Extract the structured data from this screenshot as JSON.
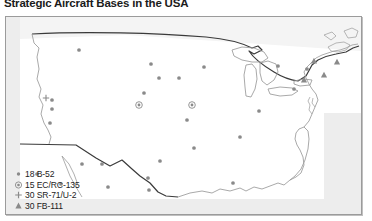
{
  "title": "Strategic Aircraft Bases in the USA",
  "colors": {
    "marker": "#8a8a8a",
    "coastline": "#9a9a9a",
    "border_line": "#3a3a3a",
    "frame": "#9b9b9b",
    "ocean": "#ededed",
    "text": "#1c1c1c"
  },
  "legend": {
    "items": [
      {
        "symbol": "dot-icon",
        "symbol_char": "•",
        "label": "18 B-52"
      },
      {
        "symbol": "circled-dot-icon",
        "symbol_char": "⊙",
        "label": "15 EC/RC-135"
      },
      {
        "symbol": "plus-icon",
        "symbol_char": "+",
        "label": "30 SR-71/U-2"
      },
      {
        "symbol": "triangle-icon",
        "symbol_char": "▲",
        "label": "30 FB-111"
      }
    ]
  },
  "map": {
    "region": "Continental United States",
    "markers": [
      {
        "type": "dot",
        "x": 73,
        "y": 33
      },
      {
        "type": "dot",
        "x": 145,
        "y": 47
      },
      {
        "type": "dot",
        "x": 153,
        "y": 61
      },
      {
        "type": "dot",
        "x": 173,
        "y": 61
      },
      {
        "type": "dot",
        "x": 198,
        "y": 50
      },
      {
        "type": "dot",
        "x": 138,
        "y": 76
      },
      {
        "type": "dot",
        "x": 46,
        "y": 83
      },
      {
        "type": "dot",
        "x": 46,
        "y": 92
      },
      {
        "type": "dot",
        "x": 44,
        "y": 106
      },
      {
        "type": "dot",
        "x": 181,
        "y": 103
      },
      {
        "type": "dot",
        "x": 188,
        "y": 131
      },
      {
        "type": "dot",
        "x": 154,
        "y": 144
      },
      {
        "type": "dot",
        "x": 142,
        "y": 161
      },
      {
        "type": "dot",
        "x": 76,
        "y": 147
      },
      {
        "type": "dot",
        "x": 96,
        "y": 147
      },
      {
        "type": "dot",
        "x": 31,
        "y": 157
      },
      {
        "type": "dot",
        "x": 55,
        "y": 167
      },
      {
        "type": "dot",
        "x": 102,
        "y": 170
      },
      {
        "type": "dot",
        "x": 143,
        "y": 173
      },
      {
        "type": "dot",
        "x": 227,
        "y": 166
      },
      {
        "type": "dot",
        "x": 272,
        "y": 49
      },
      {
        "type": "dot",
        "x": 301,
        "y": 52
      },
      {
        "type": "dot",
        "x": 288,
        "y": 72
      },
      {
        "type": "dot",
        "x": 253,
        "y": 94
      },
      {
        "type": "dot",
        "x": 234,
        "y": 120
      },
      {
        "type": "circled-dot",
        "x": 133,
        "y": 88
      },
      {
        "type": "circled-dot",
        "x": 186,
        "y": 88
      },
      {
        "type": "plus",
        "x": 40,
        "y": 81
      },
      {
        "type": "triangle",
        "x": 298,
        "y": 63
      },
      {
        "type": "triangle",
        "x": 318,
        "y": 58
      },
      {
        "type": "triangle",
        "x": 331,
        "y": 45
      },
      {
        "type": "triangle",
        "x": 308,
        "y": 44
      }
    ]
  }
}
